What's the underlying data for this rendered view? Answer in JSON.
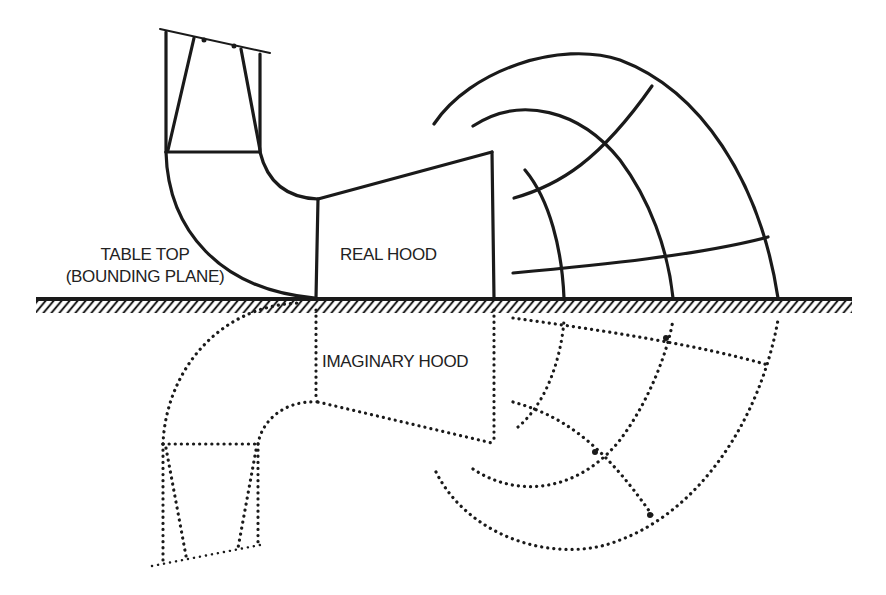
{
  "labels": {
    "table_top_line1": "TABLE TOP",
    "table_top_line2": "(BOUNDING PLANE)",
    "real_hood": "REAL HOOD",
    "imaginary_hood": "IMAGINARY HOOD"
  },
  "style": {
    "line_color": "#1a1a1a",
    "background": "#ffffff"
  }
}
